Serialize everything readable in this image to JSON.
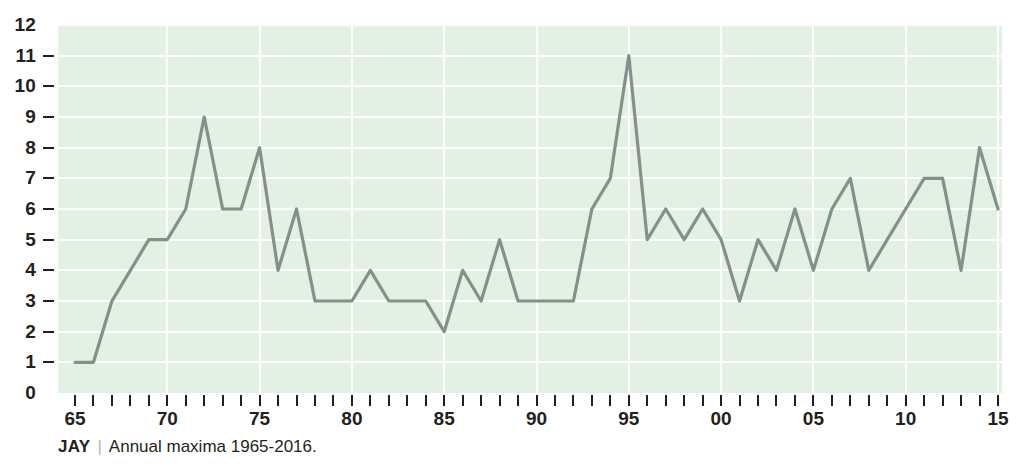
{
  "chart_data": {
    "type": "line",
    "title": "",
    "subtitle": "",
    "xlabel": "",
    "ylabel": "",
    "xlim": [
      1965,
      2016
    ],
    "ylim": [
      0,
      12
    ],
    "grid": true,
    "legend": null,
    "series_color": "#84908a",
    "plot_background": "#e2f1e4",
    "gridline_color": "#ffffff",
    "x": [
      1965,
      1966,
      1967,
      1968,
      1969,
      1970,
      1971,
      1972,
      1973,
      1974,
      1975,
      1976,
      1977,
      1978,
      1979,
      1980,
      1981,
      1982,
      1983,
      1984,
      1985,
      1986,
      1987,
      1988,
      1989,
      1990,
      1991,
      1992,
      1993,
      1994,
      1995,
      1996,
      1997,
      1998,
      1999,
      2000,
      2001,
      2002,
      2003,
      2004,
      2005,
      2006,
      2007,
      2008,
      2009,
      2010,
      2011,
      2012,
      2013,
      2014,
      2015
    ],
    "values": [
      1,
      1,
      3,
      4,
      5,
      5,
      6,
      9,
      6,
      6,
      8,
      4,
      6,
      3,
      3,
      3,
      4,
      3,
      3,
      3,
      2,
      4,
      3,
      5,
      3,
      3,
      3,
      3,
      6,
      7,
      11,
      5,
      6,
      5,
      6,
      5,
      3,
      5,
      4,
      6,
      4,
      6,
      7,
      4,
      5,
      6,
      7,
      7,
      4,
      8,
      6
    ],
    "y_ticks": [
      0,
      1,
      2,
      3,
      4,
      5,
      6,
      7,
      8,
      9,
      10,
      11,
      12
    ],
    "y_tick_labels": [
      "0",
      "1",
      "2",
      "3",
      "4",
      "5",
      "6",
      "7",
      "8",
      "9",
      "10",
      "11",
      "12"
    ],
    "x_ticks": [
      1965,
      1966,
      1967,
      1968,
      1969,
      1970,
      1971,
      1972,
      1973,
      1974,
      1975,
      1976,
      1977,
      1978,
      1979,
      1980,
      1981,
      1982,
      1983,
      1984,
      1985,
      1986,
      1987,
      1988,
      1989,
      1990,
      1991,
      1992,
      1993,
      1994,
      1995,
      1996,
      1997,
      1998,
      1999,
      2000,
      2001,
      2002,
      2003,
      2004,
      2005,
      2006,
      2007,
      2008,
      2009,
      2010,
      2011,
      2012,
      2013,
      2014,
      2015
    ],
    "x_tick_labels": [
      {
        "x": 1965,
        "label": "65"
      },
      {
        "x": 1970,
        "label": "70"
      },
      {
        "x": 1975,
        "label": "75"
      },
      {
        "x": 1980,
        "label": "80"
      },
      {
        "x": 1985,
        "label": "85"
      },
      {
        "x": 1990,
        "label": "90"
      },
      {
        "x": 1995,
        "label": "95"
      },
      {
        "x": 2000,
        "label": "00"
      },
      {
        "x": 2005,
        "label": "05"
      },
      {
        "x": 2010,
        "label": "10"
      },
      {
        "x": 2015,
        "label": "15"
      }
    ],
    "vertical_gridlines_at": [
      1970,
      1975,
      1980,
      1985,
      1990,
      1995,
      2000,
      2005,
      2010,
      2015
    ],
    "horizontal_gridlines_at": [
      1,
      2,
      3,
      4,
      5,
      6,
      7,
      8,
      9,
      10,
      11,
      12
    ]
  },
  "caption": {
    "code": "JAY",
    "separator": "|",
    "text": "Annual maxima 1965-2016."
  }
}
